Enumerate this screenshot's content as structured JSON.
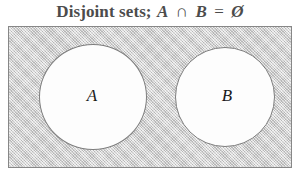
{
  "figure": {
    "title": {
      "full_text": "Disjoint sets; A ∩ B = Ø",
      "lead": "Disjoint sets;",
      "left_set": "A",
      "operator": "∩",
      "right_set": "B",
      "equals": "=",
      "result": "Ø"
    },
    "universe": {
      "name": "universal-set-rectangle",
      "fill_color": "#cccccc",
      "border_color": "#878787"
    },
    "sets": [
      {
        "label": "A",
        "fill_color": "#fdfdfd",
        "border_color": "#7d7d7d"
      },
      {
        "label": "B",
        "fill_color": "#fdfdfd",
        "border_color": "#7d7d7d"
      }
    ]
  },
  "chart_data": {
    "type": "diagram",
    "diagram_kind": "venn",
    "title": "Disjoint sets; A ∩ B = Ø",
    "sets": [
      "A",
      "B"
    ],
    "regions": [
      {
        "name": "A only",
        "shaded": false
      },
      {
        "name": "B only",
        "shaded": false
      },
      {
        "name": "A ∩ B",
        "shaded": false,
        "empty": true
      },
      {
        "name": "universe outside A and B",
        "shaded": true
      }
    ],
    "overlap": false,
    "annotations": [
      "A ∩ B = Ø"
    ]
  }
}
